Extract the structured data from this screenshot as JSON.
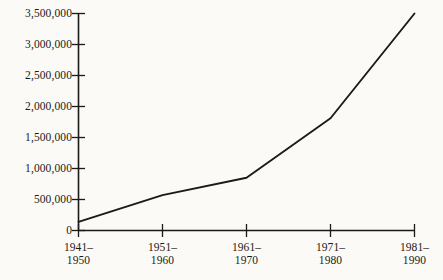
{
  "chart_data": {
    "type": "line",
    "title": "",
    "subtitle": "",
    "xlabel": "",
    "ylabel": "",
    "categories": [
      "1941–1950",
      "1951–1960",
      "1961–1970",
      "1971–1980",
      "1981–1990"
    ],
    "category_lines": [
      [
        "1941–",
        "1950"
      ],
      [
        "1951–",
        "1960"
      ],
      [
        "1961–",
        "1970"
      ],
      [
        "1971–",
        "1980"
      ],
      [
        "1981–",
        "1990"
      ]
    ],
    "values": [
      140000,
      570000,
      850000,
      1810000,
      3500000
    ],
    "series": [
      {
        "name": "",
        "values": [
          140000,
          570000,
          850000,
          1810000,
          3500000
        ]
      }
    ],
    "ylim": [
      0,
      3500000
    ],
    "yticks": [
      0,
      500000,
      1000000,
      1500000,
      2000000,
      2500000,
      3000000,
      3500000
    ],
    "ytick_labels": [
      "0",
      "500,000",
      "1,000,000",
      "1,500,000",
      "2,000,000",
      "2,500,000",
      "3,000,000",
      "3,500,000"
    ],
    "grid": false,
    "legend": false,
    "legend_position": "none",
    "line_color": "#1a1a1a",
    "axis_color": "#1a1a1a",
    "background_color": "#fbfaf7",
    "markers": false,
    "annotations": []
  }
}
